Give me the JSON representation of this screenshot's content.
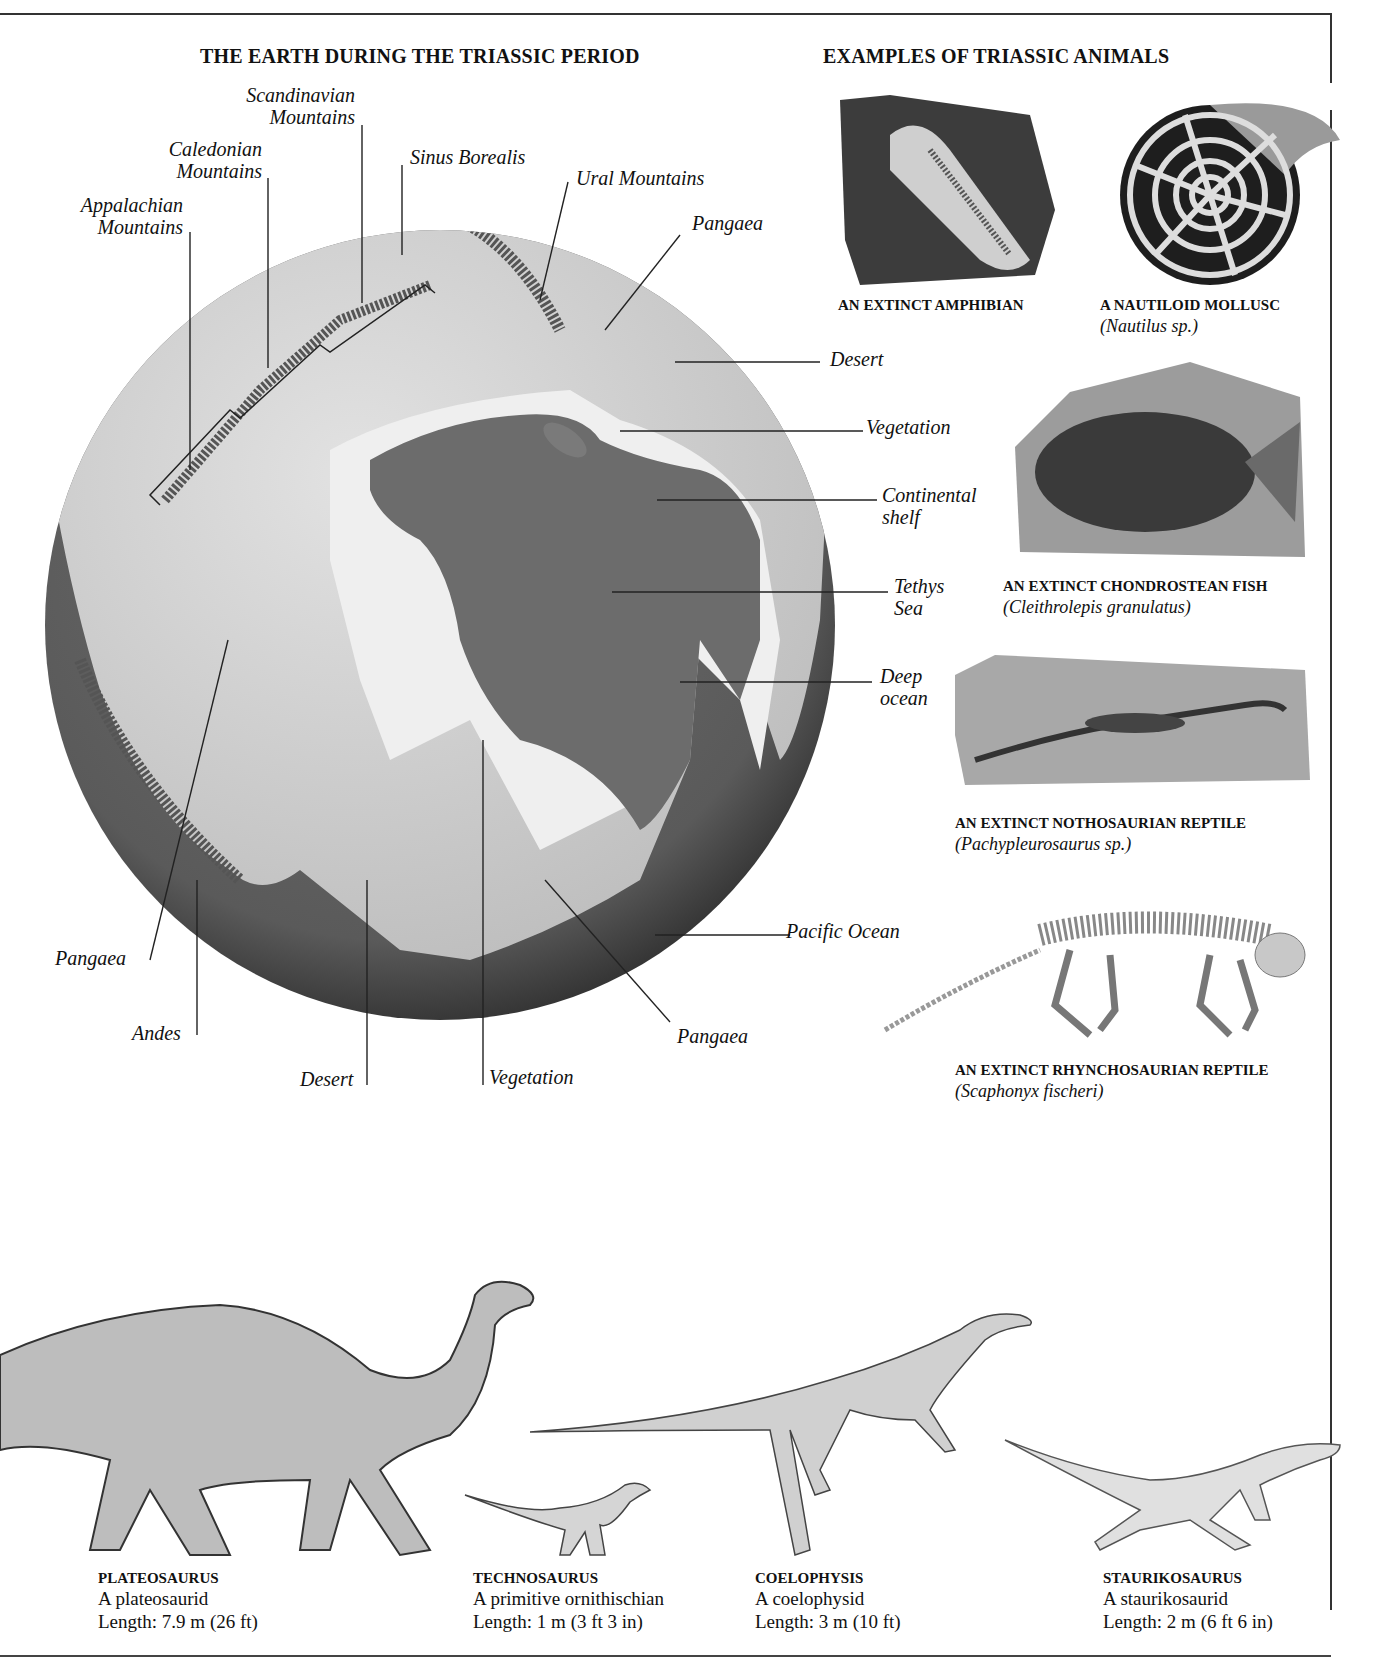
{
  "globe": {
    "title": "THE EARTH DURING THE TRIASSIC PERIOD",
    "colors": {
      "land": "#d6d6d6",
      "ocean": "#6e6e6e",
      "shelf": "#ececec",
      "shadow": "#3a3a3a"
    },
    "labels": {
      "scandinavian": [
        "Scandinavian",
        "Mountains"
      ],
      "caledonian": [
        "Caledonian",
        "Mountains"
      ],
      "appalachian": [
        "Appalachian",
        "Mountains"
      ],
      "sinus_borealis": "Sinus Borealis",
      "ural": "Ural Mountains",
      "pangaea_ne": "Pangaea",
      "desert_e": "Desert",
      "vegetation_e": "Vegetation",
      "continental_shelf": [
        "Continental",
        "shelf"
      ],
      "tethys_sea": [
        "Tethys",
        "Sea"
      ],
      "deep_ocean": [
        "Deep",
        "ocean"
      ],
      "pacific_ocean": "Pacific Ocean",
      "pangaea_w": "Pangaea",
      "andes": "Andes",
      "desert_s": "Desert",
      "vegetation_s": "Vegetation",
      "pangaea_s": "Pangaea"
    }
  },
  "animals": {
    "title": "EXAMPLES OF TRIASSIC ANIMALS",
    "items": [
      {
        "caption": "AN EXTINCT AMPHIBIAN",
        "species": ""
      },
      {
        "caption": "A NAUTILOID MOLLUSC",
        "species": "(Nautilus sp.)"
      },
      {
        "caption": "AN EXTINCT CHONDROSTEAN FISH",
        "species": "(Cleithrolepis granulatus)"
      },
      {
        "caption": "AN EXTINCT NOTHOSAURIAN REPTILE",
        "species": "(Pachypleurosaurus sp.)"
      },
      {
        "caption": "AN EXTINCT RHYNCHOSAURIAN REPTILE",
        "species": "(Scaphonyx fischeri)"
      }
    ]
  },
  "dinosaurs": [
    {
      "name": "PLATEOSAURUS",
      "group": "A plateosaurid",
      "length": "Length: 7.9 m (26 ft)"
    },
    {
      "name": "TECHNOSAURUS",
      "group": "A primitive ornithischian",
      "length": "Length: 1 m (3 ft 3 in)"
    },
    {
      "name": "COELOPHYSIS",
      "group": "A coelophysid",
      "length": "Length: 3 m (10 ft)"
    },
    {
      "name": "STAURIKOSAURUS",
      "group": "A staurikosaurid",
      "length": "Length: 2 m (6 ft 6 in)"
    }
  ]
}
